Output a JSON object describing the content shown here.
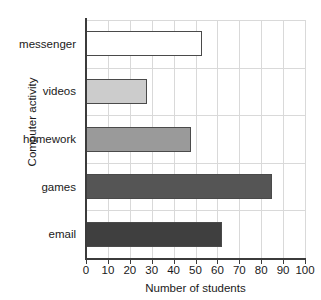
{
  "chart_data": {
    "type": "bar",
    "orientation": "horizontal",
    "title": "",
    "xlabel": "Number of students",
    "ylabel": "Computer activity",
    "categories": [
      "messenger",
      "videos",
      "homework",
      "games",
      "email"
    ],
    "values": [
      53,
      28,
      48,
      85,
      62
    ],
    "bar_colors": [
      "#ffffff",
      "#cccccc",
      "#9a9a9a",
      "#555555",
      "#3f3f3f"
    ],
    "bar_edge_color": "#4a4a4a",
    "xlim": [
      0,
      100
    ],
    "xticks": [
      0,
      10,
      20,
      30,
      40,
      50,
      60,
      70,
      80,
      90,
      100
    ],
    "xtick_labels": [
      "0",
      "10",
      "20",
      "30",
      "40",
      "50",
      "60",
      "70",
      "80",
      "90",
      "100"
    ],
    "grid": true,
    "grid_color": "#d9d9d9",
    "legend": false,
    "axis_color": "#3b3b3b"
  }
}
